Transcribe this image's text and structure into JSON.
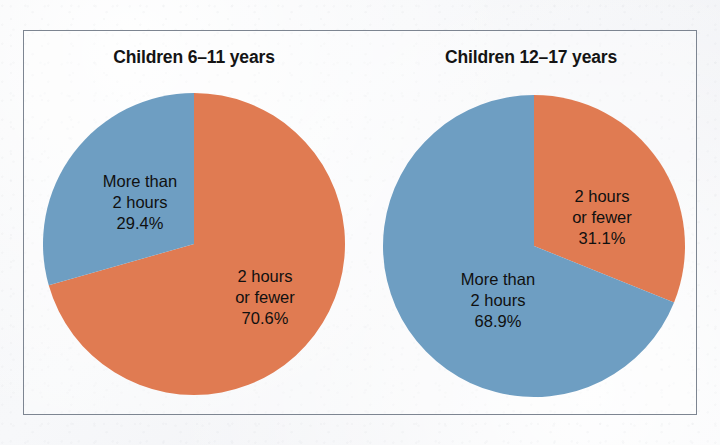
{
  "figure": {
    "background_color": "#f4f5f7",
    "frame_color": "#7d8591",
    "text_color": "#101010"
  },
  "palette": {
    "orange": "#e07b52",
    "blue": "#6e9ec2"
  },
  "chart_data": [
    {
      "type": "pie",
      "title": "Children 6–11 years",
      "categories": [
        "2 hours or fewer",
        "More than 2 hours"
      ],
      "values": [
        70.6,
        29.4
      ],
      "value_labels": [
        "70.6%",
        "29.4%"
      ],
      "colors": [
        "#e07b52",
        "#6e9ec2"
      ],
      "start_angle_deg": 0,
      "direction": "clockwise",
      "legend": "none",
      "labels_inside": true,
      "slices": [
        {
          "name": "2 hours or fewer",
          "value": 70.6,
          "color": "#e07b52",
          "label_lines": [
            "2 hours",
            "or fewer",
            "70.6%"
          ]
        },
        {
          "name": "More than 2 hours",
          "value": 29.4,
          "color": "#6e9ec2",
          "label_lines": [
            "More than",
            "2 hours",
            "29.4%"
          ]
        }
      ]
    },
    {
      "type": "pie",
      "title": "Children 12–17 years",
      "categories": [
        "2 hours or fewer",
        "More than 2 hours"
      ],
      "values": [
        31.1,
        68.9
      ],
      "value_labels": [
        "31.1%",
        "68.9%"
      ],
      "colors": [
        "#e07b52",
        "#6e9ec2"
      ],
      "start_angle_deg": 0,
      "direction": "clockwise",
      "legend": "none",
      "labels_inside": true,
      "slices": [
        {
          "name": "2 hours or fewer",
          "value": 31.1,
          "color": "#e07b52",
          "label_lines": [
            "2 hours",
            "or fewer",
            "31.1%"
          ]
        },
        {
          "name": "More than 2 hours",
          "value": 68.9,
          "color": "#6e9ec2",
          "label_lines": [
            "More than",
            "2 hours",
            "68.9%"
          ]
        }
      ]
    }
  ]
}
